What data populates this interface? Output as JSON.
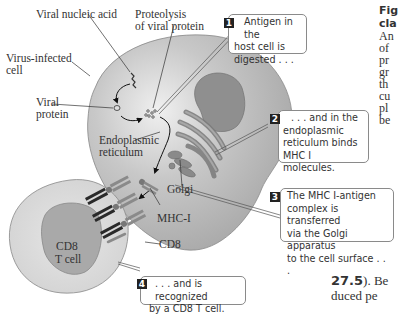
{
  "labels": {
    "viral_nucleic_acid": "Viral nucleic acid",
    "proteolysis_1": "Proteolysis",
    "proteolysis_2": "of viral protein",
    "virus_infected_1": "Virus-infected",
    "virus_infected_2": "cell",
    "viral_protein_1": "Viral",
    "viral_protein_2": "protein",
    "er_1": "Endoplasmic",
    "er_2": "reticulum",
    "golgi": "Golgi",
    "mhc1": "MHC-I",
    "cd8": "CD8",
    "tcell_1": "CD8",
    "tcell_2": "T cell"
  },
  "callouts": [
    {
      "number": "1",
      "lines": [
        "Antigen in the",
        "host cell is",
        "digested . . ."
      ]
    },
    {
      "number": "2",
      "lines": [
        ". . . and in the",
        "endoplasmic",
        "reticulum binds",
        "MHC I molecules."
      ]
    },
    {
      "number": "3",
      "lines": [
        "The MHC I-antigen",
        "complex is transferred",
        "via the Golgi apparatus",
        "to the cell surface . . ."
      ]
    },
    {
      "number": "4",
      "lines": [
        ". . . and is recognized",
        "by a CD8 T cell."
      ]
    }
  ],
  "side_text": {
    "caption_lines": [
      "Fig",
      "cla",
      "An",
      "of",
      "pr",
      "gr",
      "th",
      "cu",
      "pl",
      "be"
    ],
    "body_line_1_bold": "27.5",
    "body_line_1_rest": "). Be",
    "body_line_2": "duced pe"
  },
  "colors": {
    "cell_fill": "#b9b9b9",
    "cell_highlight": "#e9e9e9",
    "nucleus": "#8e8e8e",
    "tcell_fill": "#dcdcdc",
    "tcell_nucleus": "#aaaaaa",
    "er": "#7d7d7d",
    "receptor": "#2a2a2a"
  }
}
